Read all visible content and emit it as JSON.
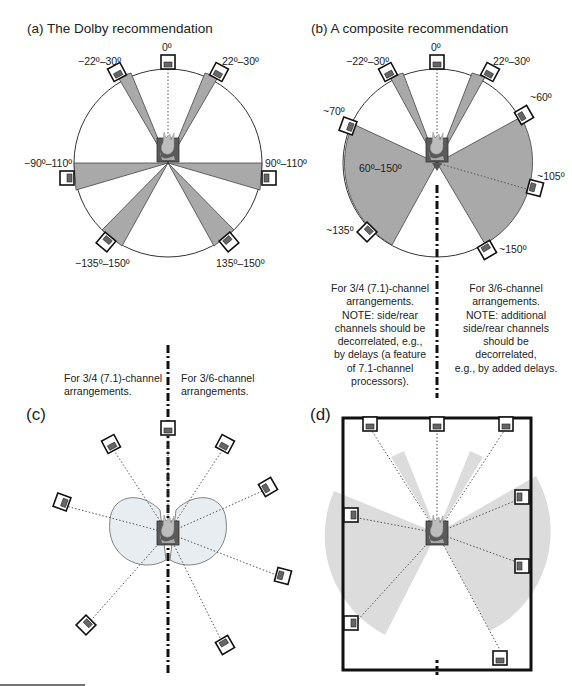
{
  "figure": {
    "panels": [
      {
        "id": "a",
        "title": "(a) The Dolby recommendation",
        "labels": [
          "0º",
          "−22º–30º",
          "22º–30º",
          "−90º–110º",
          "90º–110º",
          "−135º–150º",
          "135º–150º"
        ]
      },
      {
        "id": "b",
        "title": "(b) A composite recommendation",
        "labels": [
          "0º",
          "−22º–30º",
          "22º–30º",
          "~60º",
          "~70º",
          "60º–150º",
          "~105º",
          "~135º",
          "~150º"
        ],
        "note_left": [
          "For 3/4 (7.1)-channel",
          "arrangements.",
          "NOTE: side/rear",
          "channels should be",
          "decorrelated, e.g.,",
          "by delays (a feature",
          "of 7.1-channel",
          "processors)."
        ],
        "note_right": [
          "For 3/6-channel",
          "arrangements.",
          "NOTE: additional",
          "side/rear channels",
          "should be",
          "decorrelated,",
          "e.g., by added delays."
        ]
      },
      {
        "id": "c",
        "letter": "(c)",
        "note_left": [
          "For 3/4 (7.1)-channel",
          "arrangements."
        ],
        "note_right": [
          "For 3/6-channel",
          "arrangements."
        ]
      },
      {
        "id": "d",
        "letter": "(d)"
      }
    ],
    "colors": {
      "wedge_fill": "#a9a9a9",
      "wedge_stroke": "#444444",
      "light_fill": "#dcdcdc",
      "lobe_fill": "#e8edf2",
      "listener": "#5a5a5a"
    }
  }
}
